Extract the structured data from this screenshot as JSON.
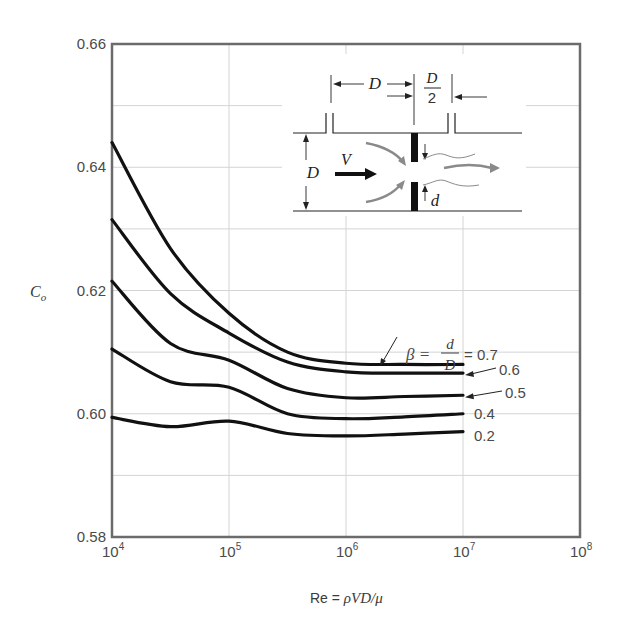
{
  "chart_data": {
    "type": "line",
    "title": "",
    "xlabel": "Re = ρVD/μ",
    "ylabel": "C_o",
    "xscale": "log",
    "xlim": [
      10000,
      100000000
    ],
    "ylim": [
      0.58,
      0.66
    ],
    "grid": true,
    "x_ticks": [
      {
        "base": "10",
        "exp": "4",
        "value": 10000
      },
      {
        "base": "10",
        "exp": "5",
        "value": 100000
      },
      {
        "base": "10",
        "exp": "6",
        "value": 1000000
      },
      {
        "base": "10",
        "exp": "7",
        "value": 10000000
      },
      {
        "base": "10",
        "exp": "8",
        "value": 100000000
      }
    ],
    "y_ticks": [
      "0.58",
      "0.60",
      "0.62",
      "0.64",
      "0.66"
    ],
    "y_tick_values": [
      0.58,
      0.6,
      0.62,
      0.64,
      0.66
    ],
    "y_minor_grid": [
      0.59,
      0.61,
      0.63,
      0.65
    ],
    "x": [
      10000,
      31623,
      100000,
      316228,
      1000000,
      3162278,
      10000000
    ],
    "log10_x": [
      4.0,
      4.5,
      5.0,
      5.5,
      6.0,
      6.5,
      7.0
    ],
    "series": [
      {
        "name": "β = 0.7",
        "label": "0.7",
        "values": [
          0.644,
          0.6268,
          0.6163,
          0.61,
          0.6082,
          0.608,
          0.608
        ]
      },
      {
        "name": "β = 0.6",
        "label": "0.6",
        "values": [
          0.6315,
          0.6195,
          0.6131,
          0.6084,
          0.6068,
          0.6066,
          0.6066
        ]
      },
      {
        "name": "β = 0.5",
        "label": "0.5",
        "values": [
          0.6215,
          0.6114,
          0.6087,
          0.6041,
          0.6026,
          0.6028,
          0.603
        ]
      },
      {
        "name": "β = 0.4",
        "label": "0.4",
        "values": [
          0.6105,
          0.6052,
          0.6043,
          0.6,
          0.5992,
          0.5995,
          0.6
        ]
      },
      {
        "name": "β = 0.2",
        "label": "0.2",
        "values": [
          0.5994,
          0.5979,
          0.5988,
          0.5968,
          0.5964,
          0.5967,
          0.5971
        ]
      }
    ],
    "annotations": {
      "beta_prefix": "β =",
      "beta_num": "d",
      "beta_den": "D",
      "beta_suffix": "= 0.7"
    },
    "inset": {
      "dim_D_top": "D",
      "dim_half_num": "D",
      "dim_half_den": "2",
      "dim_D_side": "D",
      "velocity": "V",
      "orifice_d": "d"
    }
  },
  "axes": {
    "ylabel_main": "C",
    "ylabel_sub": "o",
    "xlabel_prefix": "Re = ",
    "xlabel_italic": "ρVD/μ"
  },
  "colors": {
    "curve": "#111111",
    "axis": "#6b6b6b",
    "grid": "#d4d4d4",
    "inset_flow": "#8a8a8a"
  }
}
